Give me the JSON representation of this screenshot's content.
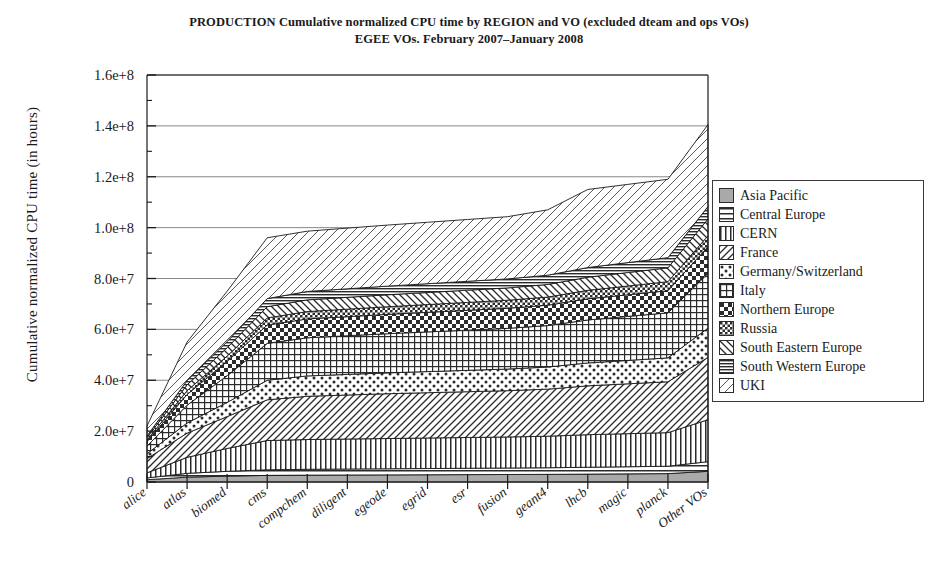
{
  "title": {
    "line1": "PRODUCTION Cumulative normalized CPU time by REGION and VO (excluded dteam and ops VOs)",
    "line2": "EGEE VOs. February 2007–January 2008"
  },
  "axes": {
    "ylabel": "Cumulative normalized CPU time (in hours)",
    "xlabel": "",
    "ytick_labels": [
      "0",
      "2.0e+7",
      "4.0e+7",
      "6.0e+7",
      "8.0e+7",
      "1.0e+8",
      "1.2e+8",
      "1.4e+8",
      "1.6e+8"
    ]
  },
  "legend": {
    "position": "right",
    "items": [
      {
        "label": "Asia Pacific",
        "pattern": "solid-gray"
      },
      {
        "label": "Central Europe",
        "pattern": "horizontal-lines"
      },
      {
        "label": "CERN",
        "pattern": "vertical-lines"
      },
      {
        "label": "France",
        "pattern": "diagonal-forward"
      },
      {
        "label": "Germany/Switzerland",
        "pattern": "dots"
      },
      {
        "label": "Italy",
        "pattern": "grid"
      },
      {
        "label": "Northern Europe",
        "pattern": "checker"
      },
      {
        "label": "Russia",
        "pattern": "dense-checker"
      },
      {
        "label": "South Eastern Europe",
        "pattern": "diagonal-back"
      },
      {
        "label": "South Western Europe",
        "pattern": "dense-horizontal"
      },
      {
        "label": "UKI",
        "pattern": "diagonal-outline"
      }
    ]
  },
  "chart_data": {
    "type": "area",
    "stacked": true,
    "xlabel": "",
    "ylabel": "Cumulative normalized CPU time (in hours)",
    "ylim": [
      0,
      160000000
    ],
    "ytick_values": [
      0,
      20000000,
      40000000,
      60000000,
      80000000,
      100000000,
      120000000,
      140000000,
      160000000
    ],
    "minor_ticks": true,
    "grid": "horizontal-major",
    "categories": [
      "alice",
      "atlas",
      "biomed",
      "cms",
      "compchem",
      "diligent",
      "egeode",
      "egrid",
      "esr",
      "fusion",
      "geant4",
      "lhcb",
      "magic",
      "planck",
      "Other VOs"
    ],
    "series": [
      {
        "name": "Asia Pacific",
        "pattern": "solid-gray",
        "values": [
          900000,
          1900000,
          2300000,
          2600000,
          2700000,
          2750000,
          2800000,
          2850000,
          2900000,
          2950000,
          3000000,
          3100000,
          3200000,
          3300000,
          4200000
        ]
      },
      {
        "name": "Central Europe",
        "pattern": "horizontal-lines",
        "values": [
          700000,
          1500000,
          1900000,
          2200000,
          2300000,
          2350000,
          2400000,
          2450000,
          2500000,
          2550000,
          2600000,
          2700000,
          2800000,
          2900000,
          3800000
        ]
      },
      {
        "name": "CERN",
        "pattern": "vertical-lines",
        "values": [
          2000000,
          6300000,
          9000000,
          11500000,
          11700000,
          11800000,
          11900000,
          12000000,
          12100000,
          12200000,
          12400000,
          12800000,
          13000000,
          13200000,
          16500000
        ]
      },
      {
        "name": "France",
        "pattern": "diagonal-forward",
        "values": [
          5600000,
          9500000,
          12500000,
          16000000,
          17000000,
          17300000,
          17600000,
          17800000,
          18000000,
          18200000,
          18500000,
          19200000,
          19600000,
          20000000,
          24500000
        ]
      },
      {
        "name": "Germany/Switzerland",
        "pattern": "dots",
        "values": [
          1900000,
          4000000,
          5600000,
          7700000,
          8000000,
          8100000,
          8200000,
          8300000,
          8400000,
          8500000,
          8700000,
          9000000,
          9200000,
          9400000,
          11500000
        ]
      },
      {
        "name": "Italy",
        "pattern": "grid",
        "values": [
          3000000,
          7000000,
          10500000,
          14500000,
          15000000,
          15200000,
          15400000,
          15600000,
          15800000,
          16000000,
          16300000,
          16900000,
          17300000,
          17700000,
          21500000
        ]
      },
      {
        "name": "Northern Europe",
        "pattern": "checker",
        "values": [
          1800000,
          4200000,
          5600000,
          7200000,
          7400000,
          7500000,
          7600000,
          7700000,
          7800000,
          7900000,
          8000000,
          8300000,
          8500000,
          8700000,
          10500000
        ]
      },
      {
        "name": "Russia",
        "pattern": "dense-checker",
        "values": [
          600000,
          1500000,
          2100000,
          2800000,
          2900000,
          2950000,
          3000000,
          3050000,
          3100000,
          3150000,
          3200000,
          3350000,
          3450000,
          3550000,
          4300000
        ]
      },
      {
        "name": "South Eastern Europe",
        "pattern": "diagonal-back",
        "values": [
          900000,
          2300000,
          3300000,
          4400000,
          4600000,
          4650000,
          4700000,
          4750000,
          4800000,
          4850000,
          4950000,
          5150000,
          5300000,
          5450000,
          6600000
        ]
      },
      {
        "name": "South Western Europe",
        "pattern": "dense-horizontal",
        "values": [
          700000,
          1700000,
          2400000,
          3200000,
          3300000,
          3350000,
          3400000,
          3450000,
          3500000,
          3550000,
          3650000,
          3800000,
          3900000,
          4000000,
          4900000
        ]
      },
      {
        "name": "UKI",
        "pattern": "diagonal-outline",
        "values": [
          3900000,
          15100000,
          19800000,
          23900000,
          23700000,
          23850000,
          24000000,
          24150000,
          24300000,
          24450000,
          25700000,
          30700000,
          30750000,
          30800000,
          32200000
        ]
      }
    ],
    "totals": [
      22000000,
      55000000,
      75000000,
      95000000,
      96600000,
      97350000,
      98000000,
      98500000,
      99200000,
      100100000,
      107000000,
      111000000,
      111000000,
      111000000,
      140500000
    ]
  }
}
